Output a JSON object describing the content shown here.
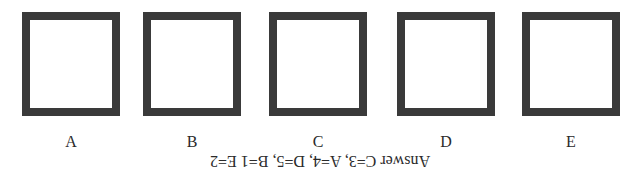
{
  "options": [
    {
      "label": "A",
      "left": 22
    },
    {
      "label": "B",
      "left": 143
    },
    {
      "label": "C",
      "left": 269
    },
    {
      "label": "D",
      "left": 397
    },
    {
      "label": "E",
      "left": 522
    }
  ],
  "answer_text": "Answer C=3, A=4, D=5, B=1 E=2",
  "colors": {
    "border": "#3a3a3a",
    "text": "#2a2a2a",
    "background": "#ffffff"
  }
}
